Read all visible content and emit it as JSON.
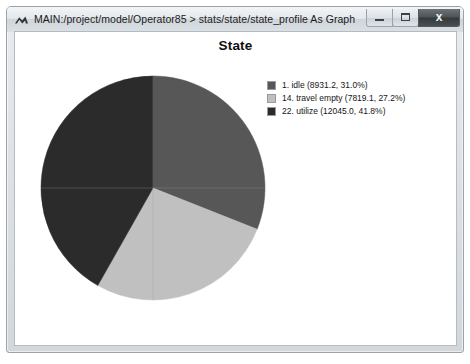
{
  "window": {
    "title": "MAIN:/project/model/Operator85 > stats/state/state_profile As Graph",
    "icon": "chevron-mountain-icon",
    "controls": {
      "minimize_label": "—",
      "maximize_label": "□",
      "close_label": "x"
    }
  },
  "chart_data": {
    "type": "pie",
    "title": "State",
    "xlabel": "",
    "ylabel": "",
    "legend_position": "right",
    "grid": false,
    "start_angle_deg": 0,
    "direction": "clockwise",
    "categories": [
      "1. idle",
      "14. travel empty",
      "22. utilize"
    ],
    "values": [
      8931.2,
      7819.1,
      12045.0
    ],
    "percentages": [
      31.0,
      27.2,
      41.8
    ],
    "colors": [
      "#575757",
      "#c0c0c0",
      "#2b2b2b"
    ],
    "slices": [
      {
        "id": "1",
        "name": "idle",
        "value": 8931.2,
        "percent": 31.0,
        "color": "#575757",
        "legend_label": "1. idle (8931.2, 31.0%)"
      },
      {
        "id": "14",
        "name": "travel empty",
        "value": 7819.1,
        "percent": 27.2,
        "color": "#c0c0c0",
        "legend_label": "14. travel empty (7819.1, 27.2%)"
      },
      {
        "id": "22",
        "name": "utilize",
        "value": 12045.0,
        "percent": 41.8,
        "color": "#2b2b2b",
        "legend_label": "22. utilize (12045.0, 41.8%)"
      }
    ]
  }
}
